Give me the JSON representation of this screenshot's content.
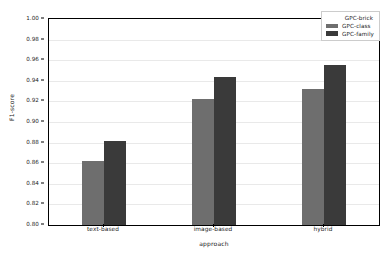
{
  "chart_data": {
    "type": "bar",
    "title": "",
    "xlabel": "approach",
    "ylabel": "F1-score",
    "categories": [
      "text-based",
      "image-based",
      "hybrid"
    ],
    "series": [
      {
        "name": "GPC-class",
        "color": "#6e6e6e",
        "values": [
          0.862,
          0.922,
          0.932
        ]
      },
      {
        "name": "GPC-family",
        "color": "#3a3a3a",
        "values": [
          0.882,
          0.944,
          0.955
        ]
      }
    ],
    "legend_title": "GPC-brick",
    "legend_position": "upper right",
    "ylim": [
      0.8,
      1.0
    ],
    "ytick_labels": [
      "0.80",
      "0.82",
      "0.84",
      "0.86",
      "0.88",
      "0.90",
      "0.92",
      "0.94",
      "0.96",
      "0.98",
      "1.00"
    ],
    "ytick_values": [
      0.8,
      0.82,
      0.84,
      0.86,
      0.88,
      0.9,
      0.92,
      0.94,
      0.96,
      0.98,
      1.0
    ],
    "grid": true,
    "grid_axis": "y",
    "grid_color": "#e9e9e9",
    "background": "#ffffff",
    "axis_color": "#000000"
  }
}
